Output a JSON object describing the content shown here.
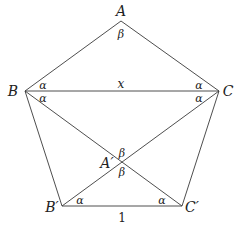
{
  "diagram": {
    "type": "geometry-pentagon",
    "vertices": [
      {
        "id": "A",
        "label": "A",
        "x": 121,
        "y": 21,
        "lx": 121,
        "ly": 16
      },
      {
        "id": "B",
        "label": "B",
        "x": 25,
        "y": 91,
        "lx": 13,
        "ly": 96
      },
      {
        "id": "C",
        "label": "C",
        "x": 219,
        "y": 91,
        "lx": 228,
        "ly": 96
      },
      {
        "id": "Bp",
        "label": "B′",
        "x": 62,
        "y": 206,
        "lx": 52,
        "ly": 212
      },
      {
        "id": "Cp",
        "label": "C′",
        "x": 182,
        "y": 206,
        "lx": 192,
        "ly": 212
      },
      {
        "id": "Ap",
        "label": "A′",
        "x": 121,
        "y": 163,
        "lx": 107,
        "ly": 168
      }
    ],
    "edges": [
      [
        "A",
        "B"
      ],
      [
        "A",
        "C"
      ],
      [
        "B",
        "C"
      ],
      [
        "B",
        "Bp"
      ],
      [
        "C",
        "Cp"
      ],
      [
        "Bp",
        "Cp"
      ],
      [
        "B",
        "Cp"
      ],
      [
        "C",
        "Bp"
      ]
    ],
    "angle_labels": [
      {
        "label": "β",
        "x": 121,
        "y": 38,
        "at": "A"
      },
      {
        "label": "α",
        "x": 43,
        "y": 89,
        "at": "B-top"
      },
      {
        "label": "α",
        "x": 43,
        "y": 102,
        "at": "B-bottom"
      },
      {
        "label": "α",
        "x": 199,
        "y": 89,
        "at": "C-top"
      },
      {
        "label": "α",
        "x": 199,
        "y": 102,
        "at": "C-bottom"
      },
      {
        "label": "β",
        "x": 122,
        "y": 157,
        "at": "A'-top"
      },
      {
        "label": "β",
        "x": 122,
        "y": 176,
        "at": "A'-bottom"
      },
      {
        "label": "α",
        "x": 80,
        "y": 204,
        "at": "B'"
      },
      {
        "label": "α",
        "x": 162,
        "y": 204,
        "at": "C'"
      }
    ],
    "length_labels": [
      {
        "label": "x",
        "x": 121,
        "y": 88,
        "side": "BC",
        "italic": true
      },
      {
        "label": "1",
        "x": 122,
        "y": 222,
        "side": "B'C'",
        "italic": false
      }
    ]
  }
}
